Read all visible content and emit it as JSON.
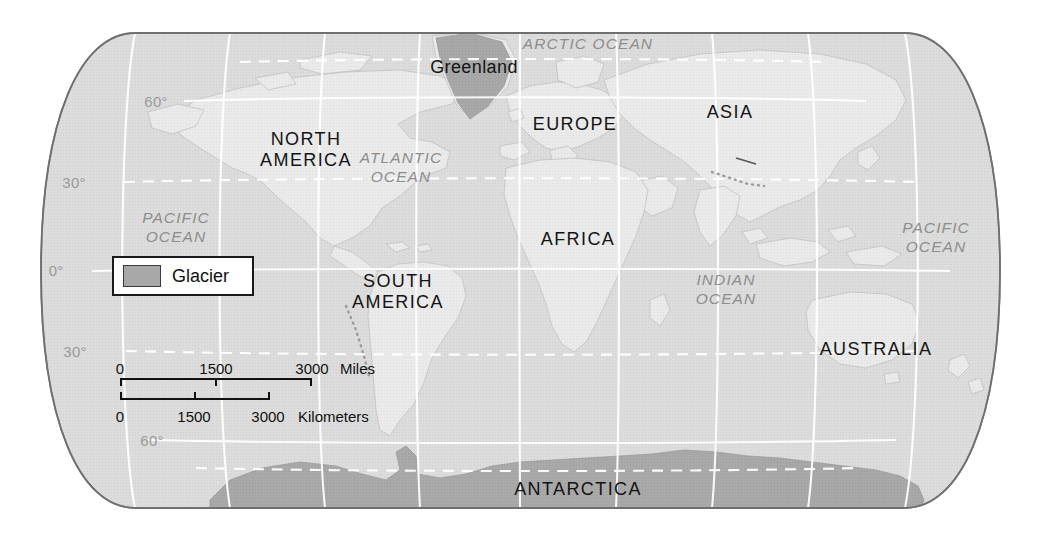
{
  "map": {
    "title": "World map with glaciers",
    "projection": "robinson",
    "background_color": "#ffffff",
    "ocean_color": "#d8d8d8",
    "land_color": "#e8e8e8",
    "glacier_color": "#a8a8a8",
    "graticule_color": "#ffffff"
  },
  "legend": {
    "swatch_label": "Glacier",
    "swatch_color": "#a8a8a8"
  },
  "scale": {
    "miles": {
      "ticks": [
        "0",
        "1500",
        "3000"
      ],
      "unit": "Miles"
    },
    "kilometers": {
      "ticks": [
        "0",
        "1500",
        "3000"
      ],
      "unit": "Kilometers"
    }
  },
  "graticule_labels": [
    {
      "text": "60°",
      "x": 156,
      "y": 101
    },
    {
      "text": "30°",
      "x": 74,
      "y": 182
    },
    {
      "text": "0°",
      "x": 56,
      "y": 270
    },
    {
      "text": "30°",
      "x": 75,
      "y": 351
    },
    {
      "text": "60°",
      "x": 152,
      "y": 440
    }
  ],
  "continent_labels": [
    {
      "text": "NORTH\nAMERICA",
      "x": 306,
      "y": 150
    },
    {
      "text": "SOUTH\nAMERICA",
      "x": 398,
      "y": 292
    },
    {
      "text": "EUROPE",
      "x": 575,
      "y": 124
    },
    {
      "text": "ASIA",
      "x": 730,
      "y": 112
    },
    {
      "text": "AFRICA",
      "x": 578,
      "y": 239
    },
    {
      "text": "AUSTRALIA",
      "x": 876,
      "y": 349
    },
    {
      "text": "ANTARCTICA",
      "x": 578,
      "y": 489
    }
  ],
  "place_labels": [
    {
      "text": "Greenland",
      "x": 474,
      "y": 67
    }
  ],
  "ocean_labels": [
    {
      "text": "ARCTIC OCEAN",
      "x": 588,
      "y": 44
    },
    {
      "text": "ATLANTIC\nOCEAN",
      "x": 401,
      "y": 168
    },
    {
      "text": "PACIFIC\nOCEAN",
      "x": 176,
      "y": 228
    },
    {
      "text": "PACIFIC\nOCEAN",
      "x": 936,
      "y": 238
    },
    {
      "text": "INDIAN\nOCEAN",
      "x": 726,
      "y": 290
    }
  ]
}
